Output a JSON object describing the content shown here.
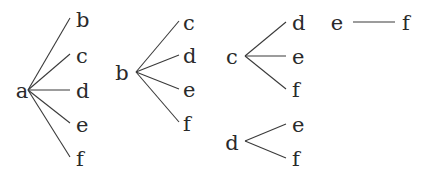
{
  "diagram": {
    "type": "tree-diagram",
    "colors": {
      "line": "#3a3a3a",
      "text": "#2a2a2a",
      "background": "#ffffff"
    },
    "trees": [
      {
        "root": "a",
        "root_pos": [
          22,
          98
        ],
        "origin": [
          28,
          90
        ],
        "children": [
          {
            "label": "b",
            "end": [
              70,
              18
            ],
            "text_pos": [
              76,
              27
            ]
          },
          {
            "label": "c",
            "end": [
              70,
              54
            ],
            "text_pos": [
              76,
              63
            ]
          },
          {
            "label": "d",
            "end": [
              70,
              90
            ],
            "text_pos": [
              76,
              98
            ]
          },
          {
            "label": "e",
            "end": [
              70,
              123
            ],
            "text_pos": [
              76,
              132
            ]
          },
          {
            "label": "f",
            "end": [
              70,
              157
            ],
            "text_pos": [
              76,
              166
            ]
          }
        ]
      },
      {
        "root": "b",
        "root_pos": [
          122,
          80
        ],
        "origin": [
          136,
          72
        ],
        "children": [
          {
            "label": "c",
            "end": [
              179,
              21
            ],
            "text_pos": [
              183,
              30
            ]
          },
          {
            "label": "d",
            "end": [
              179,
              55
            ],
            "text_pos": [
              183,
              63
            ]
          },
          {
            "label": "e",
            "end": [
              179,
              89
            ],
            "text_pos": [
              183,
              97
            ]
          },
          {
            "label": "f",
            "end": [
              179,
              122
            ],
            "text_pos": [
              183,
              131
            ]
          }
        ]
      },
      {
        "root": "c",
        "root_pos": [
          232,
          64
        ],
        "origin": [
          245,
          56
        ],
        "children": [
          {
            "label": "d",
            "end": [
              286,
              22
            ],
            "text_pos": [
              292,
              30
            ]
          },
          {
            "label": "e",
            "end": [
              286,
              56
            ],
            "text_pos": [
              292,
              64
            ]
          },
          {
            "label": "f",
            "end": [
              286,
              89
            ],
            "text_pos": [
              292,
              97
            ]
          }
        ]
      },
      {
        "root": "d",
        "root_pos": [
          232,
          150
        ],
        "origin": [
          245,
          141
        ],
        "children": [
          {
            "label": "e",
            "end": [
              286,
              124
            ],
            "text_pos": [
              292,
              132
            ]
          },
          {
            "label": "f",
            "end": [
              286,
              158
            ],
            "text_pos": [
              292,
              166
            ]
          }
        ]
      },
      {
        "root": "e",
        "root_pos": [
          337,
          30
        ],
        "origin": [
          353,
          22
        ],
        "children": [
          {
            "label": "f",
            "end": [
              395,
              22
            ],
            "text_pos": [
              402,
              30
            ]
          }
        ]
      }
    ]
  }
}
